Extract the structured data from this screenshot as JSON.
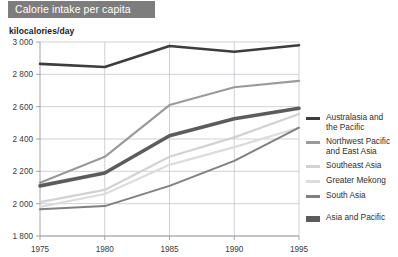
{
  "header": {
    "title": "Calorie intake per capita"
  },
  "axis": {
    "y_title": "kilocalories/day"
  },
  "legend": {
    "items": [
      {
        "label": "Australasia and\nthe Pacific",
        "color": "#3d3d3d",
        "thick": false
      },
      {
        "label": "Northwest Pacific\nand East Asia",
        "color": "#9a9a9a",
        "thick": false
      },
      {
        "label": "Southeast Asia",
        "color": "#d2d2d2",
        "thick": false
      },
      {
        "label": "Greater Mekong",
        "color": "#dcdcdc",
        "thick": false
      },
      {
        "label": "South Asia",
        "color": "#808080",
        "thick": false
      },
      {
        "label": "Asia and Pacific",
        "color": "#5c5c5c",
        "thick": true
      }
    ]
  },
  "colors": {
    "banner_bg": "#7d7d7d",
    "banner_text": "#ffffff",
    "grid": "#b9bdc4",
    "axis": "#8d9197"
  },
  "chart_data": {
    "type": "line",
    "title": "Calorie intake per capita",
    "xlabel": "",
    "ylabel": "kilocalories/day",
    "x": [
      1975,
      1980,
      1985,
      1990,
      1995
    ],
    "xtick_labels": [
      "1975",
      "1980",
      "1985",
      "1990",
      "1995"
    ],
    "ytick_labels": [
      "1 800",
      "2 000",
      "2 200",
      "2 400",
      "2 600",
      "2 800",
      "3 000"
    ],
    "yticks": [
      1800,
      2000,
      2200,
      2400,
      2600,
      2800,
      3000
    ],
    "ylim": [
      1800,
      3000
    ],
    "xlim": [
      1975,
      1995
    ],
    "grid": true,
    "legend_position": "right",
    "series": [
      {
        "name": "Australasia and the Pacific",
        "color": "#3d3d3d",
        "width": 2.6,
        "values": [
          2865,
          2845,
          2975,
          2940,
          2980
        ]
      },
      {
        "name": "Northwest Pacific and East Asia",
        "color": "#9a9a9a",
        "width": 2.2,
        "values": [
          2130,
          2290,
          2610,
          2720,
          2760
        ]
      },
      {
        "name": "Southeast Asia",
        "color": "#d2d2d2",
        "width": 2.2,
        "values": [
          2010,
          2085,
          2290,
          2410,
          2555
        ]
      },
      {
        "name": "Greater Mekong",
        "color": "#dcdcdc",
        "width": 2.2,
        "values": [
          1980,
          2060,
          2240,
          2350,
          2470
        ]
      },
      {
        "name": "South Asia",
        "color": "#808080",
        "width": 2.0,
        "values": [
          1965,
          1985,
          2110,
          2265,
          2470
        ]
      },
      {
        "name": "Asia and Pacific",
        "color": "#5c5c5c",
        "width": 3.6,
        "values": [
          2110,
          2190,
          2420,
          2525,
          2590
        ]
      }
    ]
  }
}
